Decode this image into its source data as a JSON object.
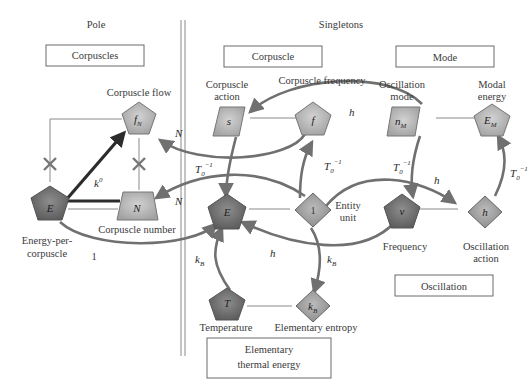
{
  "sections": {
    "pole": "Pole",
    "singletons": "Singletons"
  },
  "boxes": {
    "corpuscles": "Corpuscles",
    "corpuscle": "Corpuscle",
    "mode": "Mode",
    "oscillation": "Oscillation",
    "elementary_thermal_energy_line1": "Elementary",
    "elementary_thermal_energy_line2": "thermal energy"
  },
  "nodes": {
    "fN": {
      "symbol": "f",
      "sub": "N",
      "label": "Corpuscle flow",
      "shape": "pentagon-light"
    },
    "E_pole": {
      "symbol": "E",
      "label_line1": "Energy-per-",
      "label_line2": "corpuscle",
      "shape": "pentagon-dark"
    },
    "N": {
      "symbol": "N",
      "label": "Corpuscle number",
      "shape": "trapezoid-light"
    },
    "s": {
      "symbol": "s",
      "label_line1": "Corpuscle",
      "label_line2": "action",
      "shape": "parallelogram-light"
    },
    "f": {
      "symbol": "f",
      "label": "Corpuscle frequency",
      "shape": "pentagon-light"
    },
    "nM": {
      "symbol": "n",
      "sub": "M",
      "label_line1": "Oscillation",
      "label_line2": "mode",
      "shape": "parallelogram-light"
    },
    "EM": {
      "symbol": "E",
      "sub": "M",
      "label_line1": "Modal",
      "label_line2": "energy",
      "shape": "pentagon-light"
    },
    "E": {
      "symbol": "E",
      "shape": "pentagon-dark"
    },
    "one": {
      "symbol": "1",
      "label_line1": "Entity",
      "label_line2": "unit",
      "shape": "diamond-mid"
    },
    "nu": {
      "symbol": "ν",
      "label": "Frequency",
      "shape": "pentagon-dark"
    },
    "h": {
      "symbol": "h",
      "label_line1": "Oscillation",
      "label_line2": "action",
      "shape": "diamond-mid"
    },
    "T": {
      "symbol": "T",
      "label": "Temperature",
      "shape": "pentagon-dark"
    },
    "kB": {
      "symbol": "k",
      "sub": "B",
      "label": "Elementary entropy",
      "shape": "diamond-mid"
    }
  },
  "edge_labels": {
    "k0": "k",
    "k0_sup": "0",
    "one": "1",
    "N_top": "N",
    "N_bottom": "N",
    "T0": "T",
    "T0_sub": "0",
    "T0_sup": "−1",
    "h": "h",
    "kB": "k",
    "kB_sub": "B"
  },
  "colors": {
    "light_fill": "#b4b4b4",
    "mid_fill": "#9a9a9a",
    "dark_fill": "#6e6e6e",
    "arc": "#707070",
    "dark_arrow": "#2c2c2c"
  }
}
